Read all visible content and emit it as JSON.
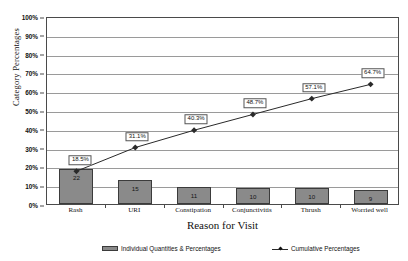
{
  "chart_data": {
    "type": "bar",
    "title": "",
    "subtitle": "",
    "xlabel": "Reason for Visit",
    "ylabel": "Category Percentages",
    "categories": [
      "Rash",
      "URI",
      "Constipation",
      "Conjunctivitis",
      "Thrush",
      "Worried well"
    ],
    "ylim": [
      0,
      100
    ],
    "ytick_labels": [
      "0%",
      "10%",
      "20%",
      "30%",
      "40%",
      "50%",
      "60%",
      "70%",
      "80%",
      "90%",
      "100%"
    ],
    "ytick_values": [
      0,
      10,
      20,
      30,
      40,
      50,
      60,
      70,
      80,
      90,
      100
    ],
    "grid": true,
    "legend_position": "bottom",
    "series": [
      {
        "name": "Individual Quantities & Percentages",
        "type": "bar",
        "values": [
          22,
          15,
          11,
          10,
          10,
          9
        ],
        "value_labels": [
          "22",
          "15",
          "11",
          "10",
          "10",
          "9"
        ],
        "percent_of_total": [
          18.5,
          12.6,
          9.2,
          8.4,
          8.4,
          7.6
        ],
        "color": "#8a8a8a"
      },
      {
        "name": "Cumulative Percentages",
        "type": "line",
        "values": [
          18.5,
          31.1,
          40.3,
          48.7,
          57.1,
          64.7
        ],
        "value_labels": [
          "18.5%",
          "31.1%",
          "40.3%",
          "48.7%",
          "57.1%",
          "64.7%"
        ],
        "color": "#2a2a2a"
      }
    ]
  },
  "axes": {
    "y_title": "Category Percentages",
    "x_title": "Reason for Visit"
  },
  "legend": {
    "items": [
      {
        "label": "Individual Quantities & Percentages",
        "marker": "bar-swatch"
      },
      {
        "label": "Cumulative Percentages",
        "marker": "line-marker"
      }
    ]
  },
  "colors": {
    "bar_fill": "#8a8a8a",
    "bar_stroke": "#3b3b3b",
    "line": "#2a2a2a",
    "grid": "#9a9a9a",
    "axis": "#4a4a4a",
    "background": "#ffffff"
  }
}
